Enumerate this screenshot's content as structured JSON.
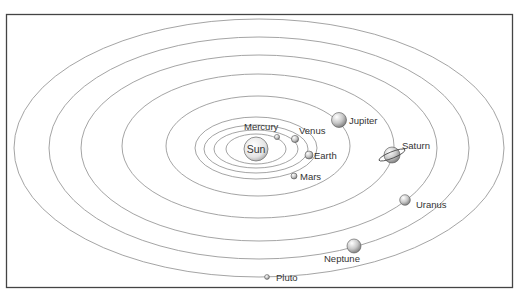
{
  "sun": {
    "label": "Sun"
  },
  "planets": [
    {
      "name": "Mercury",
      "label": "Mercury"
    },
    {
      "name": "Venus",
      "label": "Venus"
    },
    {
      "name": "Earth",
      "label": "Earth"
    },
    {
      "name": "Mars",
      "label": "Mars"
    },
    {
      "name": "Jupiter",
      "label": "Jupiter"
    },
    {
      "name": "Saturn",
      "label": "Saturn"
    },
    {
      "name": "Uranus",
      "label": "Uranus"
    },
    {
      "name": "Neptune",
      "label": "Neptune"
    },
    {
      "name": "Pluto",
      "label": "Pluto"
    }
  ],
  "colors": {
    "frame": "#444444",
    "orbit": "#9a9a9a",
    "text": "#333333",
    "planet_light": "#f4f4f4",
    "planet_dark": "#8a8a8a"
  }
}
